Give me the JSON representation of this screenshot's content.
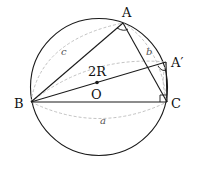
{
  "diagram": {
    "type": "geometry",
    "points": {
      "A": {
        "label": "A",
        "x": 123,
        "y": 23
      },
      "A_prime": {
        "label": "A′",
        "x": 166,
        "y": 62
      },
      "B": {
        "label": "B",
        "x": 31,
        "y": 102
      },
      "C": {
        "label": "C",
        "x": 167,
        "y": 102
      },
      "O": {
        "label": "O",
        "x": 98,
        "y": 82
      }
    },
    "sides": {
      "a": "a",
      "b": "b",
      "c": "c"
    },
    "diameter_label": "2R",
    "colors": {
      "stroke": "#1a1a1a",
      "dashed": "#bbbbbb"
    }
  }
}
